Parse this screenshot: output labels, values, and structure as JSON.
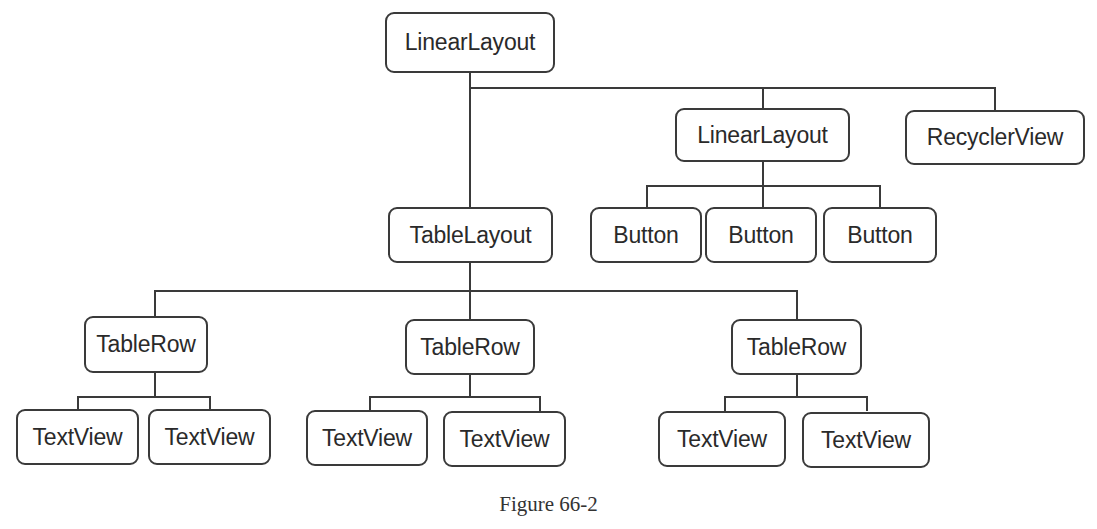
{
  "diagram": {
    "caption": "Figure 66-2",
    "line_color": "#3a3a3a",
    "nodes": {
      "root_linear_layout": "LinearLayout",
      "child_linear_layout": "LinearLayout",
      "recycler_view": "RecyclerView",
      "table_layout": "TableLayout",
      "button_1": "Button",
      "button_2": "Button",
      "button_3": "Button",
      "table_row_1": "TableRow",
      "table_row_2": "TableRow",
      "table_row_3": "TableRow",
      "text_view_1a": "TextView",
      "text_view_1b": "TextView",
      "text_view_2a": "TextView",
      "text_view_2b": "TextView",
      "text_view_3a": "TextView",
      "text_view_3b": "TextView"
    },
    "hierarchy": {
      "LinearLayout": {
        "TableLayout": {
          "TableRow 1": [
            "TextView",
            "TextView"
          ],
          "TableRow 2": [
            "TextView",
            "TextView"
          ],
          "TableRow 3": [
            "TextView",
            "TextView"
          ]
        },
        "LinearLayout": [
          "Button",
          "Button",
          "Button"
        ],
        "RecyclerView": []
      }
    }
  }
}
